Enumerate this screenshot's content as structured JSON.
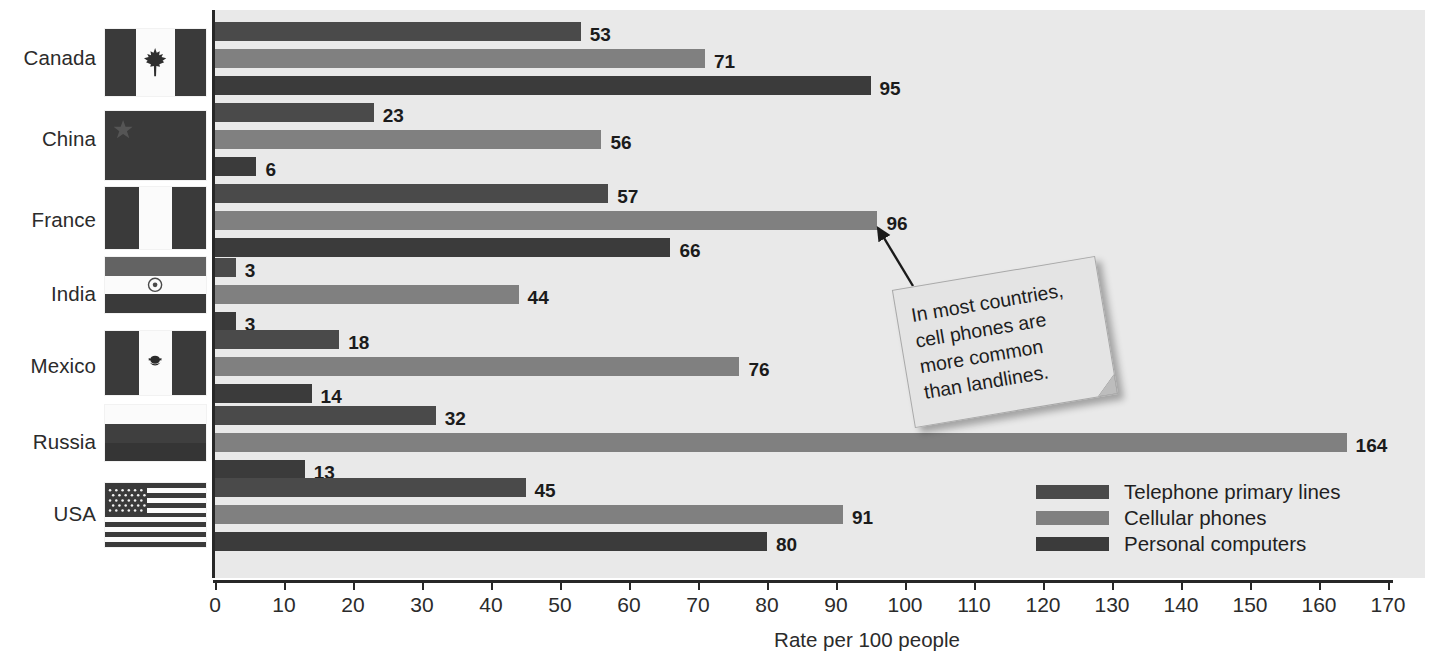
{
  "chart_data": {
    "type": "bar",
    "orientation": "horizontal",
    "title": "",
    "xlabel": "Rate per 100 people",
    "ylabel": "",
    "xlim": [
      0,
      170
    ],
    "xticks": [
      0,
      10,
      20,
      30,
      40,
      50,
      60,
      70,
      80,
      90,
      100,
      110,
      120,
      130,
      140,
      150,
      160,
      170
    ],
    "xtick_labels": [
      "0",
      "10",
      "20",
      "30",
      "40",
      "50",
      "60",
      "70",
      "80",
      "90",
      "100",
      "110",
      "120",
      "130",
      "140",
      "150",
      "160",
      "170"
    ],
    "grid": false,
    "legend_position": "inside-bottom-right",
    "categories": [
      "Canada",
      "China",
      "France",
      "India",
      "Mexico",
      "Russia",
      "USA"
    ],
    "series": [
      {
        "name": "Telephone primary lines",
        "color": "#4a4a4a",
        "values": [
          53,
          23,
          57,
          3,
          18,
          32,
          45
        ]
      },
      {
        "name": "Cellular phones",
        "color": "#808080",
        "values": [
          71,
          56,
          96,
          44,
          76,
          164,
          91
        ]
      },
      {
        "name": "Personal computers",
        "color": "#3b3b3b",
        "values": [
          95,
          6,
          66,
          3,
          14,
          13,
          80
        ]
      }
    ],
    "annotations": [
      {
        "text": "In most countries, cell phones are more common than landlines.",
        "lines": [
          "In most countries,",
          "cell phones are",
          "more common",
          "than landlines."
        ],
        "points_to": "France / Cellular phones (96)"
      }
    ]
  },
  "axis": {
    "xlabel": "Rate per 100 people",
    "ticks": [
      "0",
      "10",
      "20",
      "30",
      "40",
      "50",
      "60",
      "70",
      "80",
      "90",
      "100",
      "110",
      "120",
      "130",
      "140",
      "150",
      "160",
      "170"
    ]
  },
  "rows": [
    {
      "country": "Canada",
      "flag_name": "flag-canada",
      "values": [
        "53",
        "71",
        "95"
      ]
    },
    {
      "country": "China",
      "flag_name": "flag-china",
      "values": [
        "23",
        "56",
        "6"
      ]
    },
    {
      "country": "France",
      "flag_name": "flag-france",
      "values": [
        "57",
        "96",
        "66"
      ]
    },
    {
      "country": "India",
      "flag_name": "flag-india",
      "values": [
        "3",
        "44",
        "3"
      ]
    },
    {
      "country": "Mexico",
      "flag_name": "flag-mexico",
      "values": [
        "18",
        "76",
        "14"
      ]
    },
    {
      "country": "Russia",
      "flag_name": "flag-russia",
      "values": [
        "32",
        "164",
        "13"
      ]
    },
    {
      "country": "USA",
      "flag_name": "flag-usa",
      "values": [
        "45",
        "91",
        "80"
      ]
    }
  ],
  "legend": {
    "items": [
      {
        "label": "Telephone primary lines",
        "color": "#4a4a4a"
      },
      {
        "label": "Cellular phones",
        "color": "#808080"
      },
      {
        "label": "Personal computers",
        "color": "#3b3b3b"
      }
    ]
  },
  "callout": {
    "lines": [
      "In most countries,",
      "cell phones are",
      "more common",
      "than landlines."
    ]
  },
  "colors": {
    "plot_background": "#e9e9e9",
    "axis": "#272727",
    "series_1": "#4a4a4a",
    "series_2": "#808080",
    "series_3": "#3b3b3b",
    "text": "#2b2b2b"
  }
}
